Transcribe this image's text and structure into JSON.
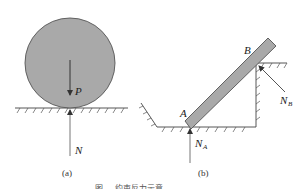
{
  "figure": {
    "caption_partial": "图 … 约束反力示意",
    "panels": [
      {
        "id": "a",
        "label": "(a)",
        "description": "Sphere resting on a smooth horizontal surface",
        "forces": [
          {
            "symbol": "P",
            "subscript": "",
            "direction": "down",
            "meaning": "weight"
          },
          {
            "symbol": "N",
            "subscript": "",
            "direction": "up",
            "meaning": "normal reaction"
          }
        ]
      },
      {
        "id": "b",
        "label": "(b)",
        "description": "Bar AB resting on a floor at A and on a corner edge at B",
        "points": [
          "A",
          "B"
        ],
        "forces": [
          {
            "symbol": "N",
            "subscript": "A",
            "direction": "up",
            "meaning": "normal reaction at A"
          },
          {
            "symbol": "N",
            "subscript": "B",
            "direction": "perpendicular to bar",
            "meaning": "normal reaction at B"
          }
        ]
      }
    ]
  },
  "colors": {
    "body_fill": "#a9a9a9",
    "body_stroke": "#555555",
    "line": "#444444",
    "text": "#222222"
  }
}
